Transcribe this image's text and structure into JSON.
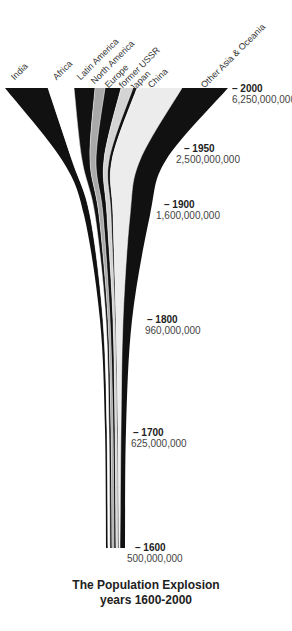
{
  "chart_data": {
    "type": "area",
    "title": "The Population Explosion",
    "subtitle": "years 1600-2000",
    "orientation": "vertical-stream",
    "x_axis": "region band (stacked horizontally)",
    "y_axis": "year (2000 at top, 1600 at bottom)",
    "years": [
      2000,
      1950,
      1900,
      1800,
      1700,
      1600
    ],
    "world_population": [
      6250000000,
      2500000000,
      1600000000,
      960000000,
      625000000,
      500000000
    ],
    "world_population_labels": [
      "6,250,000,000",
      "2,500,000,000",
      "1,600,000,000",
      "960,000,000",
      "625,000,000",
      "500,000,000"
    ],
    "legend_position": "top, rotated labels",
    "grid": false,
    "series": [
      {
        "name": "India",
        "color": "#111111"
      },
      {
        "name": "Africa",
        "color": "#ffffff"
      },
      {
        "name": "Latin America",
        "color": "#111111"
      },
      {
        "name": "North America",
        "color": "#a9a9a9"
      },
      {
        "name": "Europe",
        "color": "#111111"
      },
      {
        "name": "former USSR",
        "color": "#d4d4d4"
      },
      {
        "name": "Japan",
        "color": "#111111"
      },
      {
        "name": "China",
        "color": "#ececec"
      },
      {
        "name": "Other Asia & Oceania",
        "color": "#111111"
      }
    ],
    "band_edges_px": {
      "y": [
        88,
        160,
        215,
        320,
        430,
        548
      ],
      "edges": [
        [
          5,
          60,
          85,
          95,
          100,
          106,
          108,
          108,
          108,
          108
        ],
        [
          48,
          68,
          90,
          97,
          103,
          110,
          112,
          112,
          113,
          113
        ],
        [
          74,
          78,
          96,
          102,
          107,
          114,
          116,
          116,
          117,
          117
        ],
        [
          95,
          88,
          99,
          105,
          108,
          115,
          117,
          118,
          118,
          118
        ],
        [
          105,
          95,
          103,
          108,
          111,
          117,
          118,
          119,
          119,
          119
        ],
        [
          121,
          103,
          108,
          111,
          113,
          119,
          120,
          120,
          121,
          120
        ],
        [
          133,
          109,
          112,
          114,
          116,
          121,
          121,
          121,
          121,
          121
        ],
        [
          137,
          111,
          114,
          116,
          117,
          122,
          121,
          122,
          122,
          121
        ],
        [
          182,
          140,
          131,
          124,
          121,
          124,
          123,
          124,
          123,
          122
        ],
        [
          228,
          165,
          150,
          135,
          128,
          126,
          125,
          125,
          125,
          125
        ]
      ]
    }
  },
  "labels": {
    "regions": [
      "India",
      "Africa",
      "Latin America",
      "North America",
      "Europe",
      "former USSR",
      "Japan",
      "China",
      "Other Asia & Oceania"
    ],
    "markers": [
      {
        "year": "– 2000",
        "population": "6,250,000,000"
      },
      {
        "year": "– 1950",
        "population": "2,500,000,000"
      },
      {
        "year": "– 1900",
        "population": "1,600,000,000"
      },
      {
        "year": "– 1800",
        "population": "960,000,000"
      },
      {
        "year": "– 1700",
        "population": "625,000,000"
      },
      {
        "year": "– 1600",
        "population": "500,000,000"
      }
    ],
    "title": "The Population Explosion",
    "subtitle": "years 1600-2000"
  }
}
